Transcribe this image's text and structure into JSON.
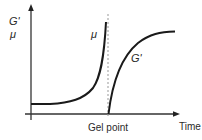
{
  "diagram": {
    "y_axis_label_line1": "G'",
    "y_axis_label_line2": "μ",
    "x_axis_label": "Time",
    "gel_point_label": "Gel point",
    "curve_viscosity_label": "μ",
    "curve_modulus_label": "G'",
    "colors": {
      "curve": "#1a1a1a",
      "axis": "#333333",
      "dashed": "#888888",
      "text": "#2a2a2a"
    }
  }
}
